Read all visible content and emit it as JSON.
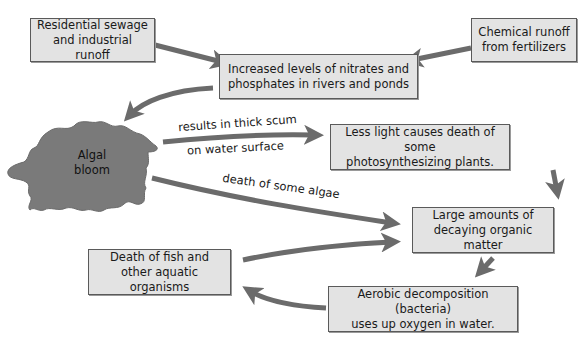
{
  "diagram": {
    "nodes": {
      "residential": "Residential sewage\nand industrial runoff",
      "chemical": "Chemical runoff\nfrom fertilizers",
      "nitrates": "Increased levels of nitrates and\nphosphates in rivers and ponds",
      "algal_bloom": "Algal\nbloom",
      "less_light": "Less light causes death of some\nphotosynthesizing plants.",
      "decaying": "Large amounts of\ndecaying organic matter",
      "death_fish": "Death of fish and\nother aquatic organisms",
      "aerobic": "Aerobic decomposition (bacteria)\nuses up oxygen in water."
    },
    "edge_labels": {
      "scum_line1": "results in thick scum",
      "scum_line2": "on water surface",
      "algae_death": "death of some algae"
    },
    "colors": {
      "box_fill": "#e3e3e3",
      "box_border": "#5a5a5a",
      "arrow": "#6b6b6b",
      "bloom": "#7a7a7a"
    }
  }
}
